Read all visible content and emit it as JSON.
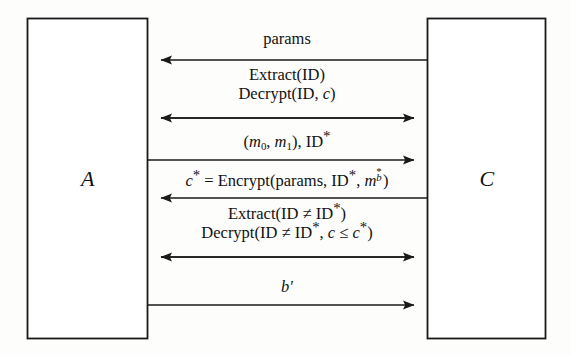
{
  "diagram": {
    "type": "protocol-sequence-diagram",
    "background_color": "#fdfdfc",
    "line_color": "#1a1a1a",
    "parties": [
      {
        "id": "A",
        "label": "A",
        "side": "left"
      },
      {
        "id": "C",
        "label": "C",
        "side": "right"
      }
    ],
    "messages": [
      {
        "index": 1,
        "direction": "left",
        "from": "C",
        "to": "A",
        "lines": [
          "params"
        ],
        "text": "params"
      },
      {
        "index": 2,
        "direction": "both",
        "from": "A",
        "to": "C",
        "lines": [
          "Extract(ID)",
          "Decrypt(ID, c)"
        ],
        "text": "Extract(ID) Decrypt(ID, c)"
      },
      {
        "index": 3,
        "direction": "right",
        "from": "A",
        "to": "C",
        "lines": [
          "(m0, m1), ID*"
        ],
        "text": "(m_0, m_1), ID*"
      },
      {
        "index": 4,
        "direction": "left",
        "from": "C",
        "to": "A",
        "lines": [
          "c* = Encrypt(params, ID*, m*_b)"
        ],
        "text": "c* = Encrypt(params, ID*, m*_b)"
      },
      {
        "index": 5,
        "direction": "both",
        "from": "A",
        "to": "C",
        "lines": [
          "Extract(ID ≠ ID*)",
          "Decrypt(ID ≠ ID*, c ≤ c*)"
        ],
        "text": "Extract(ID ≠ ID*) Decrypt(ID ≠ ID*, c ≤ c*)"
      },
      {
        "index": 6,
        "direction": "right",
        "from": "A",
        "to": "C",
        "lines": [
          "b′"
        ],
        "text": "b′"
      }
    ],
    "glyphs": {
      "params": "params",
      "extract": "Extract",
      "decrypt": "Decrypt",
      "encrypt": "Encrypt",
      "id": "ID",
      "star": "*",
      "not_equal": "≠",
      "less_equal": "≤",
      "equals": "=",
      "open_paren": "(",
      "close_paren": ")",
      "comma": ",",
      "m": "m",
      "c": "c",
      "b_prime": "b′",
      "zero": "0",
      "one": "1",
      "b": "b"
    }
  }
}
